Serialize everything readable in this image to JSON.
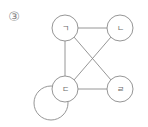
{
  "figure": {
    "number_label": "③",
    "colors": {
      "stroke": "#8a8a8a",
      "text": "#6a6a6a",
      "background": "#ffffff"
    }
  },
  "graph": {
    "nodes": [
      {
        "id": "g",
        "label": "ㄱ",
        "cx": 65,
        "cy": 28,
        "r": 13
      },
      {
        "id": "n",
        "label": "ㄴ",
        "cx": 120,
        "cy": 28,
        "r": 13
      },
      {
        "id": "d",
        "label": "ㄷ",
        "cx": 65,
        "cy": 89,
        "r": 13
      },
      {
        "id": "r",
        "label": "ㄹ",
        "cx": 120,
        "cy": 89,
        "r": 13
      }
    ],
    "edges": [
      {
        "from": "ㄱ",
        "to": "ㄴ"
      },
      {
        "from": "ㄱ",
        "to": "ㄷ"
      },
      {
        "from": "ㄱ",
        "to": "ㄹ"
      },
      {
        "from": "ㄴ",
        "to": "ㄷ"
      },
      {
        "from": "ㄷ",
        "to": "ㄹ"
      }
    ],
    "self_loops": [
      {
        "node": "ㄷ",
        "cx": 51,
        "cy": 103,
        "r": 17
      }
    ]
  }
}
